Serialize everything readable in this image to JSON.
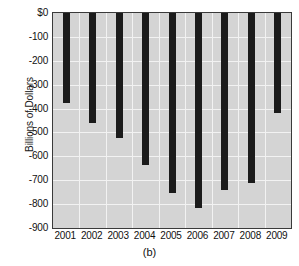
{
  "chart_data": {
    "type": "bar",
    "title": "",
    "subtitle": "",
    "caption": "(b)",
    "xlabel": "",
    "ylabel": "Billions of Dollars",
    "categories": [
      "2001",
      "2002",
      "2003",
      "2004",
      "2005",
      "2006",
      "2007",
      "2008",
      "2009"
    ],
    "values": [
      -375,
      -460,
      -525,
      -635,
      -755,
      -815,
      -740,
      -710,
      -420
    ],
    "ylim": [
      -900,
      0
    ],
    "ytick_labels": [
      "$0",
      "-100",
      "-200",
      "-300",
      "-400",
      "-500",
      "-600",
      "-700",
      "-800",
      "-900"
    ],
    "ytick_values": [
      0,
      -100,
      -200,
      -300,
      -400,
      -500,
      -600,
      -700,
      -800,
      -900
    ],
    "grid": true,
    "legend": false,
    "bar_color": "#1b1b1b",
    "plot_background": "#d4d4d4",
    "gridline_color": "#f2f2f2",
    "axis_color": "#3a3a3a"
  }
}
